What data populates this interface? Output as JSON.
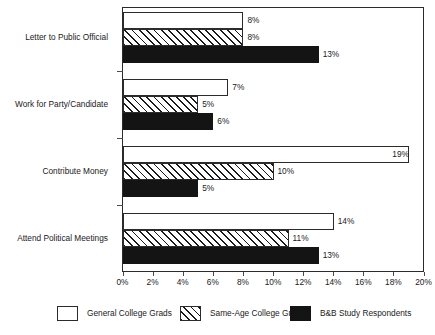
{
  "chart_data": {
    "type": "bar",
    "orientation": "horizontal",
    "title": "",
    "subtitle": "",
    "xlabel": "",
    "ylabel": "",
    "xlim": [
      0,
      20
    ],
    "xtick_labels": [
      "0%",
      "2%",
      "4%",
      "6%",
      "8%",
      "10%",
      "12%",
      "14%",
      "16%",
      "18%",
      "20%"
    ],
    "xtick_values": [
      0,
      2,
      4,
      6,
      8,
      10,
      12,
      14,
      16,
      18,
      20
    ],
    "grid": false,
    "legend_position": "bottom",
    "categories": [
      "Letter to Public Official",
      "Work for Party/Candidate",
      "Contribute Money",
      "Attend Political Meetings"
    ],
    "series": [
      {
        "name": "General College Grads",
        "fill": "white",
        "values": [
          8,
          7,
          19,
          14
        ],
        "labels": [
          "8%",
          "7%",
          "19%",
          "14%"
        ]
      },
      {
        "name": "Same-Age College Grads",
        "fill": "hatched",
        "values": [
          8,
          5,
          10,
          11
        ],
        "labels": [
          "8%",
          "5%",
          "10%",
          "11%"
        ]
      },
      {
        "name": "B&B Study Respondents",
        "fill": "black",
        "values": [
          13,
          6,
          5,
          13
        ],
        "labels": [
          "13%",
          "6%",
          "5%",
          "13%"
        ]
      }
    ]
  },
  "colors": {
    "axis": "#2b2b2b",
    "tick": "#4a4a4a",
    "text": "#1a1a1a",
    "series_general": "#ffffff",
    "series_sameage": "#1a1a1a",
    "series_bnb": "#141414",
    "background": "#ffffff"
  }
}
